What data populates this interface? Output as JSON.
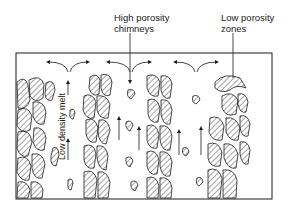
{
  "diagram": {
    "labels": {
      "high_porosity": [
        "High porosity",
        "chimneys"
      ],
      "low_porosity": [
        "Low porosity",
        "zones"
      ],
      "melt": "Low density melt"
    },
    "frame": {
      "x": 16,
      "y": 53,
      "width": 256,
      "height": 146
    },
    "colors": {
      "line": "#1a1a1a",
      "background": "#ffffff"
    }
  }
}
